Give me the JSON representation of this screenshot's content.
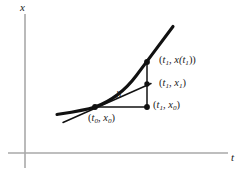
{
  "figure": {
    "axes": {
      "vertical_label": "x",
      "horizontal_label": "t",
      "color": "#a9a9a9",
      "origin": [
        25,
        153
      ],
      "vertical_top": [
        25,
        14
      ],
      "vertical_bottom": [
        25,
        168
      ],
      "horizontal_right": [
        228,
        153
      ]
    },
    "curve": {
      "name": "solution-curve",
      "color": "#111111",
      "label": "x(t)",
      "points": [
        [
          57,
          114
        ],
        [
          74,
          111
        ],
        [
          95,
          107
        ],
        [
          115,
          97
        ],
        [
          133,
          80
        ],
        [
          147,
          62
        ],
        [
          162,
          41
        ],
        [
          172,
          28
        ]
      ]
    },
    "tangent_line": {
      "name": "tangent-line",
      "color": "#111111",
      "from": [
        64,
        122
      ],
      "to": [
        150,
        84
      ],
      "slope_note": "tangent at (t0, x0)"
    },
    "segments": {
      "step_horizontal": {
        "from": [
          95,
          107
        ],
        "to": [
          147,
          107
        ]
      },
      "vertical_drop": {
        "from": [
          147,
          62
        ],
        "to": [
          147,
          107
        ]
      }
    },
    "points": [
      {
        "name": "point-t0-x0",
        "x": 95,
        "y": 107
      },
      {
        "name": "point-t1-x0",
        "x": 147,
        "y": 107
      },
      {
        "name": "point-t1-x1",
        "x": 147,
        "y": 84
      },
      {
        "name": "point-t1-xt1",
        "x": 147,
        "y": 62
      }
    ],
    "labels": {
      "curve_point": {
        "prefix": "(",
        "t": "t",
        "t_sub": "1",
        "sep": ", ",
        "x": "x(t",
        "x_sub": "1",
        "suffix": "))"
      },
      "tangent_point": {
        "prefix": "(",
        "t": "t",
        "t_sub": "1",
        "sep": ", ",
        "x": "x",
        "x_sub": "1",
        "suffix": ")"
      },
      "base_right": {
        "prefix": "(",
        "t": "t",
        "t_sub": "1",
        "sep": ", ",
        "x": "x",
        "x_sub": "0",
        "suffix": ")"
      },
      "base_left": {
        "prefix": "(",
        "t": "t",
        "t_sub": "0",
        "sep": ", ",
        "x": "x",
        "x_sub": "0",
        "suffix": ")"
      },
      "step_size": "h"
    }
  }
}
